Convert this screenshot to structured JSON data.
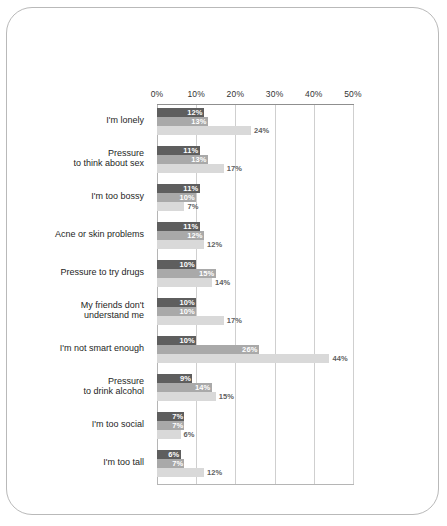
{
  "chart_data": {
    "type": "bar",
    "orientation": "horizontal",
    "title": "",
    "subtitle": "",
    "xlabel": "",
    "ylabel": "",
    "xlim": [
      0,
      50
    ],
    "grid": true,
    "legend": "none",
    "xticks": [
      "0%",
      "10%",
      "20%",
      "30%",
      "40%",
      "50%"
    ],
    "xtick_values": [
      0,
      10,
      20,
      30,
      40,
      50
    ],
    "categories": [
      "I'm lonely",
      "Pressure\nto think about sex",
      "I'm too bossy",
      "Acne or skin problems",
      "Pressure to try drugs",
      "My friends don't\nunderstand me",
      "I'm not smart enough",
      "Pressure\nto drink alcohol",
      "I'm too social",
      "I'm too tall"
    ],
    "series": [
      {
        "name": "series-1",
        "color": "#5e5e5e",
        "values": [
          12,
          11,
          11,
          11,
          10,
          10,
          10,
          9,
          7,
          6
        ]
      },
      {
        "name": "series-2",
        "color": "#a9a9a9",
        "values": [
          13,
          13,
          10,
          12,
          15,
          10,
          26,
          14,
          7,
          7
        ]
      },
      {
        "name": "series-3",
        "color": "#d9d9d9",
        "values": [
          24,
          17,
          7,
          12,
          14,
          17,
          44,
          15,
          6,
          12
        ]
      }
    ],
    "value_labels": [
      [
        "12%",
        "13%",
        "24%"
      ],
      [
        "11%",
        "13%",
        "17%"
      ],
      [
        "11%",
        "10%",
        "7%"
      ],
      [
        "11%",
        "12%",
        "12%"
      ],
      [
        "10%",
        "15%",
        "14%"
      ],
      [
        "10%",
        "10%",
        "17%"
      ],
      [
        "10%",
        "26%",
        "44%"
      ],
      [
        "9%",
        "14%",
        "15%"
      ],
      [
        "7%",
        "7%",
        "6%"
      ],
      [
        "6%",
        "7%",
        "12%"
      ]
    ]
  }
}
